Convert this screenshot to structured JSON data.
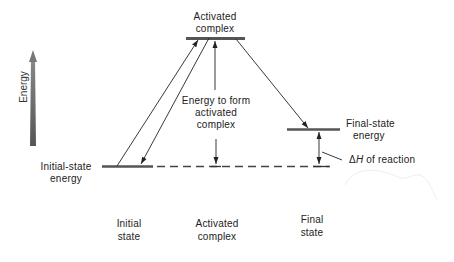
{
  "diagram": {
    "axis": {
      "label": "Energy",
      "direction": "up"
    },
    "levels": {
      "activated_complex": "Activated complex",
      "initial_state": "Initial-state energy",
      "final_state": "Final-state energy"
    },
    "labels": {
      "activated_line1": "Activated",
      "activated_line2": "complex",
      "energy_form_line1": "Energy to form",
      "energy_form_line2": "activated",
      "energy_form_line3": "complex",
      "final_state_line1": "Final-state",
      "final_state_line2": "energy",
      "delta_symbol": "Δ",
      "delta_h_var": "H",
      "delta_h_rest": " of reaction",
      "initial_energy_line1": "Initial-state",
      "initial_energy_line2": "energy"
    },
    "states": [
      {
        "line1": "Initial",
        "line2": "state"
      },
      {
        "line1": "Activated",
        "line2": "complex"
      },
      {
        "line1": "Final",
        "line2": "state"
      }
    ],
    "colors": {
      "ink": "#222222",
      "level_bar": "#555555",
      "energy_arrow": "#666666"
    }
  }
}
